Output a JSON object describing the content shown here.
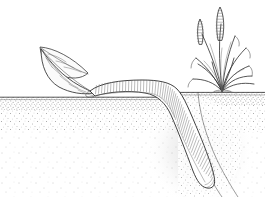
{
  "image": {
    "title": "Earthworm dragging a leaf into its burrow",
    "style": "black-and-white stipple line drawing",
    "width": 265,
    "height": 197,
    "background_color": "#ffffff",
    "ink_color": "#2b2b2b"
  },
  "scene": {
    "ground": {
      "label": "soil ground surface",
      "left_surface_y": 97,
      "right_surface_y": 92,
      "surface_line_color": "#3a3a3a",
      "soil_color": "#ffffff",
      "stipple_color": "#8a8a8a",
      "stipple_dense_band_height": 14,
      "burrow_mouth_x": 178
    },
    "leaf": {
      "label": "fallen leaf",
      "description": "two overlapping pointed leaf blades with midribs and side veins, tip at upper left, base resting on soil at the worm's mouth",
      "tip_x": 40,
      "tip_y": 47,
      "base_x": 92,
      "base_y": 93,
      "lobe_count": 2,
      "vein_count": 7,
      "fill_color": "#fbfbfb"
    },
    "worm": {
      "label": "earthworm",
      "description": "segmented annelid body lying on the surface at left, bending over the burrow rim and descending diagonally down-right into the soil, rounded tail tip near bottom",
      "head_x": 90,
      "head_y": 90,
      "tail_x": 213,
      "tail_y": 186,
      "segment_count": 62,
      "body_width_surface": 13,
      "body_width_burrow": 16,
      "fill_color": "#ffffff",
      "segment_line_color": "#4a4a4a"
    },
    "burrow": {
      "label": "worm burrow",
      "description": "tunnel walls drawn as two curving lines running from the surface opening down to the lower right",
      "opening_x": 180,
      "opening_y": 92,
      "bottom_x": 222,
      "bottom_y": 197
    },
    "plant": {
      "label": "grass tuft with seed heads",
      "description": "clump of narrow grass blades radiating from a base at the soil line, with two upright seed spikes",
      "base_x": 222,
      "base_y": 91,
      "blade_count": 12,
      "seed_head_count": 2,
      "seed_heads": [
        {
          "name": "left seed spike",
          "x": 201,
          "y": 22,
          "height": 24,
          "segments": 9
        },
        {
          "name": "right seed spike",
          "x": 221,
          "y": 10,
          "height": 30,
          "segments": 11
        }
      ]
    }
  }
}
